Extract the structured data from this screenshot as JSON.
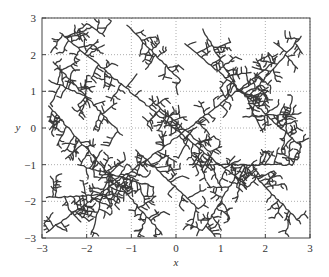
{
  "chart_data": {
    "type": "scatter",
    "subtype": "dendritic-fractal-pattern",
    "title": "",
    "xlabel": "x",
    "ylabel": "y",
    "xlim": [
      -3,
      3
    ],
    "ylim": [
      -3,
      3
    ],
    "xticks": [
      -3,
      -2,
      -1,
      0,
      1,
      2,
      3
    ],
    "yticks": [
      -3,
      -2,
      -1,
      0,
      1,
      2,
      3
    ],
    "xtick_labels": [
      "−3",
      "−2",
      "−1",
      "0",
      "1",
      "2",
      "3"
    ],
    "ytick_labels": [
      "−3",
      "−2",
      "−1",
      "0",
      "1",
      "2",
      "3"
    ],
    "grid": "dotted",
    "legend": null,
    "stroke_color": "#3a3a3a",
    "main_branches": [
      {
        "from": [
          -2.9,
          -2.85
        ],
        "to": [
          -0.3,
          -0.55
        ]
      },
      {
        "from": [
          -0.3,
          -0.55
        ],
        "to": [
          2.2,
          1.8
        ]
      },
      {
        "from": [
          -2.85,
          0.6
        ],
        "to": [
          -0.3,
          -2.9
        ]
      },
      {
        "from": [
          -2.75,
          1.8
        ],
        "to": [
          -1.2,
          -0.2
        ]
      },
      {
        "from": [
          -2.6,
          2.6
        ],
        "to": [
          -0.05,
          0.0
        ]
      },
      {
        "from": [
          -0.05,
          0.0
        ],
        "to": [
          1.6,
          -1.6
        ]
      },
      {
        "from": [
          -1.1,
          2.8
        ],
        "to": [
          0.1,
          1.3
        ]
      },
      {
        "from": [
          0.6,
          2.7
        ],
        "to": [
          1.4,
          1.0
        ]
      },
      {
        "from": [
          1.0,
          1.5
        ],
        "to": [
          2.8,
          -0.5
        ]
      },
      {
        "from": [
          2.8,
          2.5
        ],
        "to": [
          1.6,
          0.8
        ]
      },
      {
        "from": [
          1.5,
          0.3
        ],
        "to": [
          2.8,
          0.4
        ]
      },
      {
        "from": [
          0.3,
          -1.0
        ],
        "to": [
          2.6,
          -1.0
        ]
      },
      {
        "from": [
          1.5,
          -1.0
        ],
        "to": [
          2.8,
          -2.6
        ]
      },
      {
        "from": [
          1.5,
          -1.0
        ],
        "to": [
          0.6,
          -2.8
        ]
      },
      {
        "from": [
          -1.5,
          -1.2
        ],
        "to": [
          -1.9,
          -2.9
        ]
      },
      {
        "from": [
          -2.2,
          -1.0
        ],
        "to": [
          -0.5,
          -1.6
        ]
      },
      {
        "from": [
          -2.9,
          -1.9
        ],
        "to": [
          -1.3,
          -1.8
        ]
      },
      {
        "from": [
          -0.6,
          0.8
        ],
        "to": [
          0.8,
          -0.7
        ]
      },
      {
        "from": [
          0.2,
          2.3
        ],
        "to": [
          1.0,
          1.5
        ]
      },
      {
        "from": [
          -1.9,
          0.8
        ],
        "to": [
          -2.85,
          1.3
        ]
      },
      {
        "from": [
          -1.6,
          2.5
        ],
        "to": [
          -2.0,
          2.85
        ]
      },
      {
        "from": [
          -0.9,
          -0.6
        ],
        "to": [
          0.5,
          -2.2
        ]
      }
    ]
  }
}
